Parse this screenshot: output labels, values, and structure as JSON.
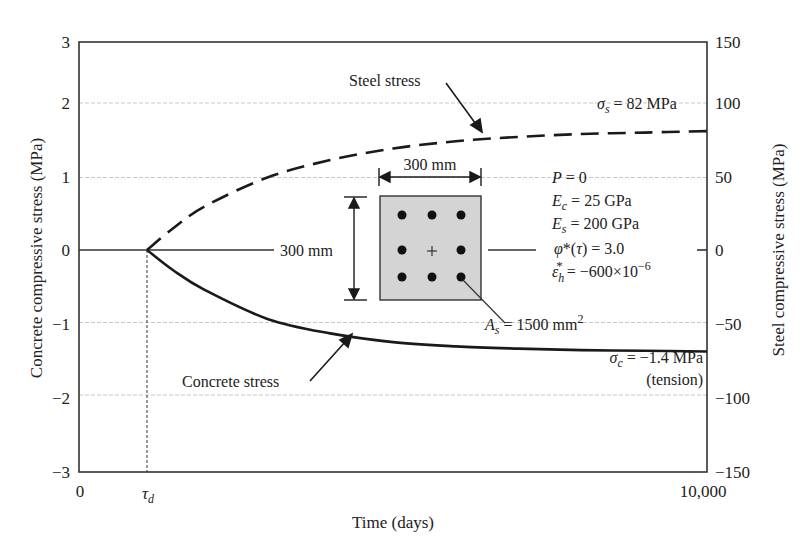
{
  "chart_data": {
    "type": "line",
    "title": "",
    "xlabel": "Time (days)",
    "ylabel": "Concrete compressive stress (MPa)",
    "ylabel_right": "Steel compressive stress (MPa)",
    "xlim": [
      0,
      10000
    ],
    "ylim": [
      -3,
      3
    ],
    "ylim_right": [
      -150,
      150
    ],
    "grid": true,
    "x_ticks": [
      "0",
      "τd",
      "10,000"
    ],
    "y_ticks": [
      "3",
      "2",
      "1",
      "0",
      "−1",
      "−2",
      "−3"
    ],
    "y_ticks_right": [
      "150",
      "100",
      "50",
      "0",
      "−50",
      "−100",
      "−150"
    ],
    "series": [
      {
        "name": "Steel stress",
        "axis": "right",
        "style": "dashed",
        "x": [
          1100,
          1500,
          2000,
          3000,
          4000,
          5000,
          6000,
          7000,
          8000,
          9000,
          10000
        ],
        "values": [
          0,
          15,
          30,
          50,
          62,
          70,
          75,
          78,
          80,
          81,
          82
        ]
      },
      {
        "name": "Concrete stress",
        "axis": "left",
        "style": "solid",
        "x": [
          1100,
          1500,
          2000,
          3000,
          4000,
          5000,
          6000,
          7000,
          8000,
          9000,
          10000
        ],
        "values": [
          0,
          -0.28,
          -0.55,
          -0.95,
          -1.15,
          -1.27,
          -1.33,
          -1.36,
          -1.38,
          -1.39,
          -1.4
        ]
      }
    ],
    "annotations": {
      "steel_label": "Steel stress",
      "concrete_label": "Concrete stress",
      "sigma_s_final": "= 82 MPa",
      "sigma_c_final": "= −1.4 MPa",
      "tension_note": "(tension)",
      "section_width": "300 mm",
      "section_depth": "300 mm",
      "steel_area_value": "= 1500 mm",
      "steel_area_exp": "2",
      "params": {
        "P": "= 0",
        "Ec": "= 25 GPa",
        "Es": "= 200 GPa",
        "phi": "= 3.0",
        "eps": "= −600×10",
        "eps_exp": "−6"
      }
    },
    "colors": {
      "line": "#1a1a1a",
      "axis": "#333333",
      "grid": "#c8c8c8",
      "section_fill": "#d4d4d4"
    }
  }
}
